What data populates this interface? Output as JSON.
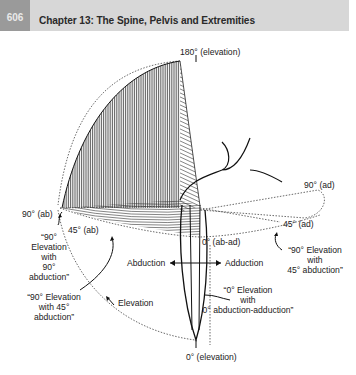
{
  "header": {
    "page_number": "606",
    "chapter_title": "Chapter 13: The Spine, Pelvis and Extremities"
  },
  "figure": {
    "labels": {
      "elevation_180": "180° (elevation)",
      "ad_90": "90° (ad)",
      "ad_45": "45° (ad)",
      "ab_ad_0": "0° (ab-ad)",
      "ab_90": "90° (ab)",
      "ab_45": "45° (ab)",
      "elev90_ab90": [
        "“90°",
        "Elevation",
        "with",
        "90°",
        "abduction”"
      ],
      "elev90_ab45_right": [
        "“90° Elevation",
        "with",
        "45° abduction”"
      ],
      "abduction": "Abduction",
      "adduction": "Adduction",
      "elev90_ab45_left": [
        "“90° Elevation",
        "with 45°",
        "abduction”"
      ],
      "elevation": "Elevation",
      "elev0_abad0": [
        "“0° Elevation",
        "with",
        "0° abduction-adduction”"
      ],
      "elevation_0": "0° (elevation)"
    }
  }
}
